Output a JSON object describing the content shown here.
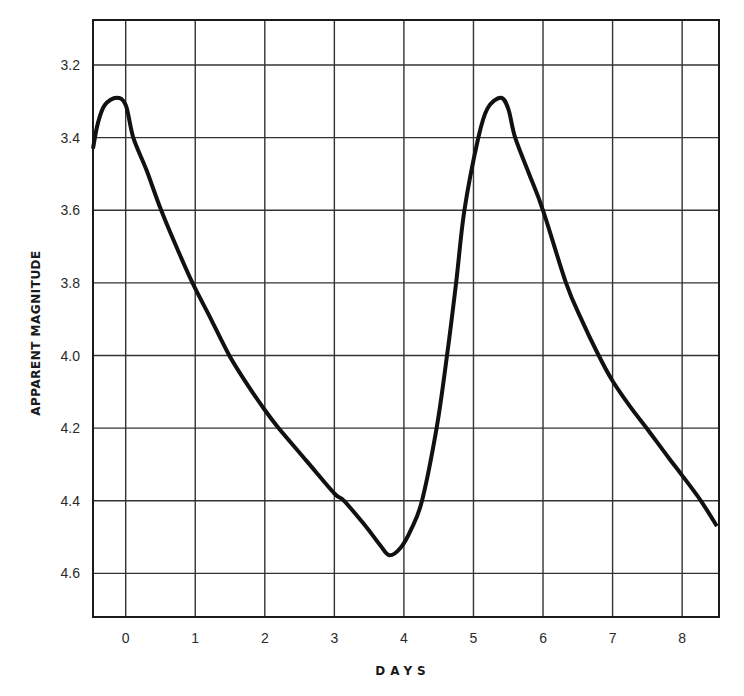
{
  "chart_data": {
    "type": "line",
    "title": "",
    "xlabel": "DAYS",
    "ylabel": "APPARENT MAGNITUDE",
    "xlim": [
      -0.47,
      8.53
    ],
    "ylim": [
      4.72,
      3.076
    ],
    "y_inverted": true,
    "grid": true,
    "legend": null,
    "x_ticks": [
      0,
      1,
      2,
      3,
      4,
      5,
      6,
      7,
      8
    ],
    "x_tick_labels": [
      "0",
      "1",
      "2",
      "3",
      "4",
      "5",
      "6",
      "7",
      "8"
    ],
    "y_ticks": [
      3.2,
      3.4,
      3.6,
      3.8,
      4.0,
      4.2,
      4.4,
      4.6
    ],
    "y_tick_labels": [
      "3.2",
      "3.4",
      "3.6",
      "3.8",
      "4.0",
      "4.2",
      "4.4",
      "4.6"
    ],
    "series": [
      {
        "name": "light curve",
        "color": "#111111",
        "x": [
          -0.47,
          -0.4,
          -0.3,
          -0.13,
          0.0,
          0.11,
          0.3,
          0.51,
          0.75,
          0.96,
          1.2,
          1.49,
          1.75,
          2.0,
          2.2,
          2.6,
          3.0,
          3.14,
          3.45,
          3.65,
          3.79,
          3.95,
          4.1,
          4.26,
          4.47,
          4.62,
          4.75,
          4.87,
          5.07,
          5.2,
          5.39,
          5.5,
          5.6,
          5.8,
          6.0,
          6.33,
          6.55,
          6.8,
          7.0,
          7.25,
          7.49,
          7.8,
          8.0,
          8.27,
          8.5
        ],
        "y": [
          3.43,
          3.36,
          3.31,
          3.29,
          3.31,
          3.4,
          3.49,
          3.6,
          3.71,
          3.8,
          3.89,
          4.0,
          4.08,
          4.15,
          4.2,
          4.29,
          4.38,
          4.4,
          4.47,
          4.52,
          4.55,
          4.53,
          4.48,
          4.4,
          4.2,
          4.0,
          3.8,
          3.6,
          3.4,
          3.32,
          3.29,
          3.32,
          3.4,
          3.5,
          3.6,
          3.8,
          3.9,
          4.0,
          4.07,
          4.14,
          4.2,
          4.28,
          4.33,
          4.4,
          4.47
        ]
      }
    ]
  }
}
